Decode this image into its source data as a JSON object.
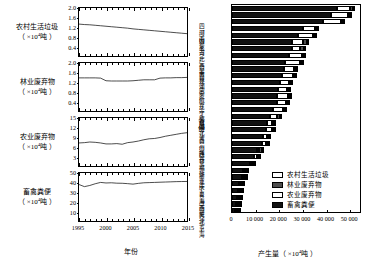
{
  "chart_data": [
    {
      "type": "line",
      "id": "rural-domestic-waste-timeseries",
      "title": "农村生活垃圾",
      "ylabel": "农村生活垃圾（×10⁴吨）",
      "ylabel_main": "农村生活垃圾",
      "ylabel_unit": "（ ×10 吨 ）",
      "unit_exp": "4",
      "xlabel": "年份",
      "xlim": [
        1995,
        2015
      ],
      "ylim": [
        0,
        2.0
      ],
      "yticks": [
        0.4,
        0.8,
        1.2,
        1.6,
        2.0
      ],
      "ytick_labels": [
        "0.4",
        "0.8",
        "1.2",
        "1.6",
        "2.0"
      ],
      "x": [
        1995,
        1996,
        1997,
        1998,
        1999,
        2000,
        2001,
        2002,
        2003,
        2004,
        2005,
        2006,
        2007,
        2008,
        2009,
        2010,
        2011,
        2012,
        2013,
        2014,
        2015
      ],
      "values": [
        1.33,
        1.31,
        1.3,
        1.28,
        1.26,
        1.24,
        1.22,
        1.2,
        1.18,
        1.16,
        1.13,
        1.11,
        1.09,
        1.07,
        1.05,
        1.03,
        1.01,
        0.99,
        0.97,
        0.95,
        0.93
      ]
    },
    {
      "type": "line",
      "id": "forestry-waste-timeseries",
      "title": "林业废弃物",
      "ylabel_main": "林业废弃物",
      "ylabel_unit": "（ ×10 吨 ）",
      "unit_exp": "4",
      "xlabel": "年份",
      "xlim": [
        1995,
        2015
      ],
      "ylim": [
        0,
        2.0
      ],
      "yticks": [
        0.4,
        0.8,
        1.2,
        1.6,
        2.0
      ],
      "ytick_labels": [
        "0.4",
        "0.8",
        "1.2",
        "1.6",
        "2.0"
      ],
      "x": [
        1995,
        1996,
        1997,
        1998,
        1999,
        2000,
        2001,
        2002,
        2003,
        2004,
        2005,
        2006,
        2007,
        2008,
        2009,
        2010,
        2011,
        2012,
        2013,
        2014,
        2015
      ],
      "values": [
        1.38,
        1.38,
        1.38,
        1.38,
        1.37,
        1.26,
        1.25,
        1.25,
        1.25,
        1.25,
        1.26,
        1.28,
        1.3,
        1.3,
        1.3,
        1.37,
        1.38,
        1.38,
        1.39,
        1.39,
        1.4
      ]
    },
    {
      "type": "line",
      "id": "agricultural-waste-timeseries",
      "title": "农业废弃物",
      "ylabel_main": "农业废弃物",
      "ylabel_unit": "（ ×10 吨 ）",
      "unit_exp": "4",
      "xlabel": "年份",
      "xlim": [
        1995,
        2015
      ],
      "ylim": [
        0,
        15
      ],
      "yticks": [
        3,
        6,
        9,
        12,
        15
      ],
      "ytick_labels": [
        "3",
        "6",
        "9",
        "12",
        "15"
      ],
      "x": [
        1995,
        1996,
        1997,
        1998,
        1999,
        2000,
        2001,
        2002,
        2003,
        2004,
        2005,
        2006,
        2007,
        2008,
        2009,
        2010,
        2011,
        2012,
        2013,
        2014,
        2015
      ],
      "values": [
        7.2,
        7.3,
        7.5,
        7.4,
        7.2,
        6.9,
        6.9,
        7.0,
        6.8,
        7.3,
        7.5,
        7.8,
        8.2,
        8.5,
        8.6,
        8.9,
        9.3,
        9.6,
        9.9,
        10.2,
        10.4
      ]
    },
    {
      "type": "line",
      "id": "livestock-manure-timeseries",
      "title": "畜禽粪便",
      "ylabel_main": "畜禽粪便",
      "ylabel_unit": "（ ×10 吨 ）",
      "unit_exp": "4",
      "xlabel": "年份",
      "xlim": [
        1995,
        2015
      ],
      "ylim": [
        0,
        50
      ],
      "yticks": [
        10,
        20,
        30,
        40,
        50
      ],
      "ytick_labels": [
        "10",
        "20",
        "30",
        "40",
        "50"
      ],
      "xticks": [
        1995,
        2000,
        2005,
        2010,
        2015
      ],
      "xtick_labels": [
        "1995",
        "2000",
        "2005",
        "2010",
        "2015"
      ],
      "x": [
        1995,
        1996,
        1997,
        1998,
        1999,
        2000,
        2001,
        2002,
        2003,
        2004,
        2005,
        2006,
        2007,
        2008,
        2009,
        2010,
        2011,
        2012,
        2013,
        2014,
        2015
      ],
      "values": [
        38.0,
        35.8,
        37.0,
        38.8,
        40.2,
        39.6,
        39.8,
        39.4,
        39.3,
        38.9,
        38.4,
        39.2,
        39.8,
        40.0,
        40.2,
        40.4,
        40.6,
        40.8,
        41.0,
        41.1,
        41.2
      ]
    },
    {
      "type": "bar",
      "id": "province-biomass-stacked-bar",
      "orientation": "horizontal",
      "stacked": true,
      "xlabel": "产生量（ ×10⁴吨 ）",
      "xlabel_main": "产生量（ ×10 吨 ）",
      "unit_exp": "4",
      "ylabel": "省份",
      "xlim": [
        0,
        55000
      ],
      "xticks": [
        0,
        10000,
        20000,
        30000,
        40000,
        50000
      ],
      "xtick_labels": [
        "0",
        "10 000",
        "20 000",
        "30 000",
        "40 000",
        "50 000"
      ],
      "legend_position": "bottom-right",
      "categories": [
        "四川",
        "河南",
        "山东",
        "内蒙古",
        "河北",
        "广西",
        "云南",
        "吉林",
        "黑龙江",
        "湖南",
        "安徽",
        "广东",
        "辽宁",
        "江苏",
        "新疆",
        "湖北",
        "江西",
        "贵州",
        "山西",
        "陕西",
        "甘肃",
        "福建",
        "浙江",
        "重庆",
        "宁夏",
        "青海",
        "海南",
        "西藏",
        "天津",
        "北京",
        "上海"
      ],
      "series": [
        {
          "name": "农村生活垃圾",
          "color": "#ffffff",
          "values": [
            320,
            290,
            270,
            130,
            240,
            180,
            190,
            130,
            150,
            200,
            170,
            210,
            120,
            180,
            90,
            170,
            140,
            150,
            110,
            120,
            90,
            90,
            110,
            80,
            25,
            25,
            40,
            20,
            30,
            45,
            40
          ]
        },
        {
          "name": "林业废弃物",
          "color": "#4d4d4d",
          "values": [
            1500,
            360,
            300,
            900,
            420,
            1650,
            1700,
            900,
            1200,
            900,
            520,
            800,
            800,
            300,
            500,
            650,
            950,
            800,
            350,
            700,
            420,
            900,
            760,
            350,
            90,
            200,
            300,
            250,
            40,
            120,
            40
          ]
        },
        {
          "name": "农业废弃物",
          "color": "#ffffff",
          "values": [
            5400,
            7200,
            7800,
            5200,
            6400,
            4700,
            3300,
            5600,
            6100,
            4300,
            4800,
            3600,
            3700,
            4600,
            3700,
            3900,
            3200,
            2100,
            2300,
            2000,
            1700,
            1100,
            1000,
            700,
            750,
            300,
            300,
            150,
            450,
            300,
            280
          ]
        },
        {
          "name": "畜禽粪便",
          "color": "#111111",
          "values": [
            44500,
            42000,
            38500,
            30000,
            28000,
            25500,
            25300,
            24000,
            22500,
            22000,
            21200,
            20500,
            19500,
            19000,
            19200,
            17500,
            16000,
            15000,
            14500,
            13000,
            12800,
            10500,
            9500,
            7800,
            4700,
            4200,
            3100,
            2600,
            2200,
            1800,
            1400
          ]
        }
      ]
    }
  ],
  "left_panels": [
    {
      "label_main": "农村生活垃圾",
      "label_unit_pre": "（ ×10",
      "label_unit_exp": "4",
      "label_unit_post": "吨 ）"
    },
    {
      "label_main": "林业废弃物",
      "label_unit_pre": "（ ×10",
      "label_unit_exp": "4",
      "label_unit_post": "吨 ）"
    },
    {
      "label_main": "农业废弃物",
      "label_unit_pre": "（ ×10",
      "label_unit_exp": "4",
      "label_unit_post": "吨 ）"
    },
    {
      "label_main": "畜禽粪便",
      "label_unit_pre": "（ ×10",
      "label_unit_exp": "4",
      "label_unit_post": "吨 ）"
    }
  ],
  "left_xaxis": {
    "label": "年份",
    "tick_labels": [
      "1995",
      "2000",
      "2005",
      "2010",
      "2015"
    ]
  },
  "bar_axis": {
    "ylabel": "省份",
    "xlabel_pre": "产生量（ ×10",
    "xlabel_exp": "4",
    "xlabel_post": "吨 ）",
    "xtick_labels": [
      "0",
      "10 000",
      "20 000",
      "30 000",
      "40 000",
      "50 000"
    ]
  },
  "legend": {
    "items": [
      {
        "label": "农村生活垃圾",
        "swatch": "c0"
      },
      {
        "label": "林业废弃物",
        "swatch": "c1"
      },
      {
        "label": "农业废弃物",
        "swatch": "c2"
      },
      {
        "label": "畜禽粪便",
        "swatch": "c3"
      }
    ]
  },
  "colors": {
    "rural_domestic_waste": "#ffffff",
    "forestry_waste": "#4d4d4d",
    "agricultural_waste": "#ffffff",
    "livestock_manure": "#111111",
    "axis": "#000000",
    "background": "#ffffff"
  }
}
